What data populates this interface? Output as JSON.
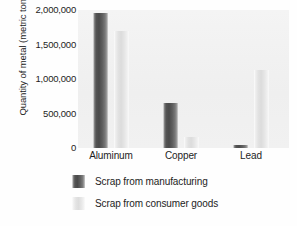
{
  "chart_data": {
    "type": "bar",
    "title": "",
    "xlabel": "",
    "ylabel": "Quantity of metal (metric tons)",
    "categories": [
      "Aluminum",
      "Copper",
      "Lead"
    ],
    "series": [
      {
        "name": "Scrap from manufacturing",
        "color": "#4a4a4a",
        "values": [
          1950000,
          650000,
          45000
        ]
      },
      {
        "name": "Scrap from consumer goods",
        "color": "#dcdcdc",
        "values": [
          1700000,
          155000,
          1130000
        ]
      }
    ],
    "ylim": [
      0,
      2000000
    ],
    "yticks": [
      0,
      500000,
      1000000,
      1500000,
      2000000
    ],
    "ytick_labels": [
      "0",
      "500,000",
      "1,000,000",
      "1,500,000",
      "2,000,000"
    ],
    "grid": false,
    "legend_position": "bottom-left"
  },
  "legend": {
    "entries": [
      {
        "label": "Scrap from manufacturing",
        "swatch": "dark"
      },
      {
        "label": "Scrap from consumer goods",
        "swatch": "light"
      }
    ]
  }
}
